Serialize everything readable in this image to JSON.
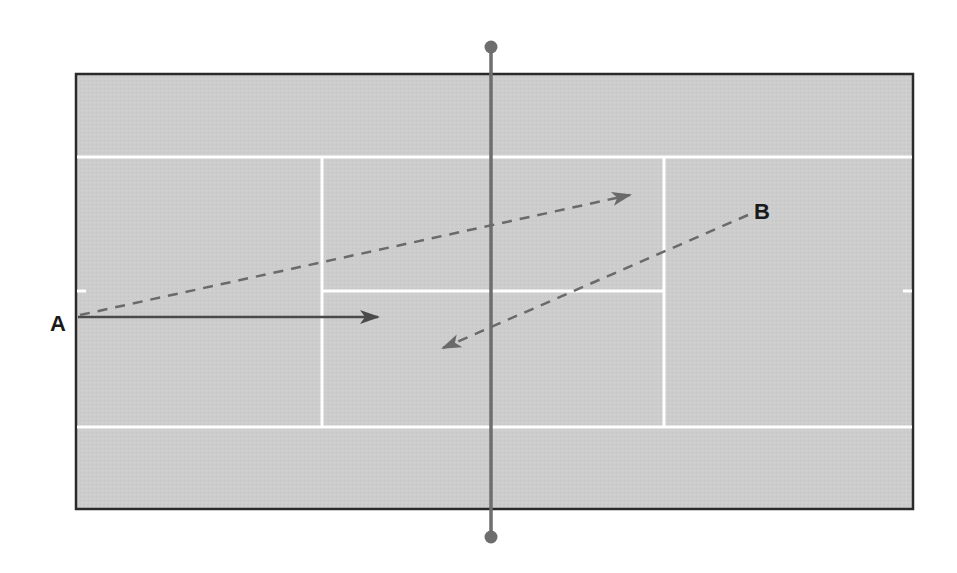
{
  "diagram": {
    "title": "",
    "colors": {
      "court_surface": "#cdcdcd",
      "court_border": "#2a2a2a",
      "court_lines": "#ffffff",
      "net": "#6e6e6e",
      "arrow_solid": "#4a4a4a",
      "arrow_dashed": "#6a6a6a",
      "label": "#1a1a1a"
    },
    "labels": {
      "a": "A",
      "b": "B"
    },
    "paths": [
      {
        "id": "A-solid",
        "from": "A",
        "style": "solid",
        "description": "straight shot from A toward center service box"
      },
      {
        "id": "A-dashed",
        "from": "A",
        "style": "dashed",
        "description": "cross-court shot from A to far service box"
      },
      {
        "id": "B-dashed",
        "from": "B",
        "style": "dashed",
        "description": "return from B back across the net"
      }
    ]
  }
}
